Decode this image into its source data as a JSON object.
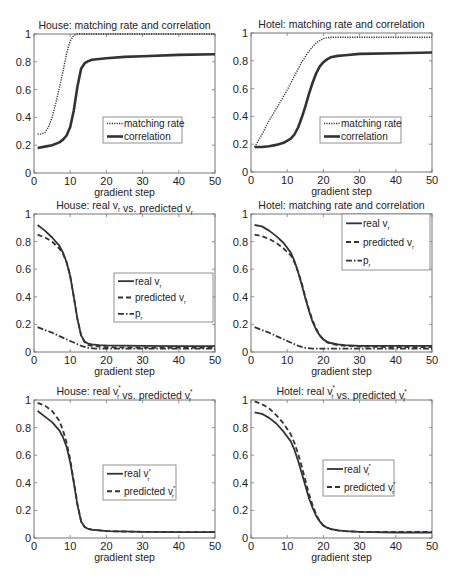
{
  "figure": {
    "width": 452,
    "height": 578,
    "line_color": "#333333",
    "axis_color": "#777777"
  },
  "chart_data": [
    {
      "id": "house-match",
      "type": "line",
      "title": "House: matching rate and correlation",
      "title_parts": [
        {
          "t": "House: matching rate and correlation"
        }
      ],
      "xlabel": "gradient step",
      "ylabel": "",
      "xlim": [
        0,
        50
      ],
      "ylim": [
        0,
        1
      ],
      "xticks": [
        0,
        10,
        20,
        30,
        40,
        50
      ],
      "yticks": [
        0,
        0.2,
        0.4,
        0.6,
        0.8,
        1
      ],
      "ytick_labels": [
        "0",
        "0.2",
        "0.4",
        "0.6",
        "0.8",
        "1"
      ],
      "grid": false,
      "box": {
        "x0": 34,
        "y0": 34,
        "x1": 215,
        "y1": 173
      },
      "legend": {
        "x": 103,
        "y": 117,
        "w": 79,
        "h": 26
      },
      "series": [
        {
          "name": "matching rate",
          "label_parts": [
            {
              "t": "matching rate"
            }
          ],
          "style": "dotted",
          "width": 1.4,
          "x": [
            1,
            2,
            3,
            4,
            5,
            6,
            7,
            8,
            9,
            10,
            11,
            12,
            13,
            14,
            15,
            20,
            30,
            40,
            50
          ],
          "y": [
            0.28,
            0.28,
            0.29,
            0.33,
            0.4,
            0.5,
            0.61,
            0.73,
            0.86,
            0.95,
            0.99,
            1.0,
            1.0,
            1.0,
            1.0,
            1.0,
            1.0,
            1.0,
            1.0
          ]
        },
        {
          "name": "correlation",
          "label_parts": [
            {
              "t": "correlation"
            }
          ],
          "style": "solid",
          "width": 2.6,
          "x": [
            1,
            3,
            5,
            7,
            8,
            9,
            10,
            11,
            12,
            13,
            14,
            15,
            16,
            18,
            20,
            25,
            30,
            40,
            50
          ],
          "y": [
            0.18,
            0.19,
            0.2,
            0.22,
            0.24,
            0.27,
            0.33,
            0.45,
            0.62,
            0.75,
            0.79,
            0.805,
            0.815,
            0.82,
            0.825,
            0.835,
            0.84,
            0.85,
            0.855
          ]
        }
      ]
    },
    {
      "id": "hotel-match",
      "type": "line",
      "title": "Hotel: matching rate and correlation",
      "title_parts": [
        {
          "t": "Hotel: matching rate and correlation"
        }
      ],
      "xlabel": "gradient step",
      "ylabel": "",
      "xlim": [
        0,
        50
      ],
      "ylim": [
        0,
        1
      ],
      "xticks": [
        0,
        10,
        20,
        30,
        40,
        50
      ],
      "yticks": [
        0,
        0.2,
        0.4,
        0.6,
        0.8,
        1
      ],
      "ytick_labels": [
        "0",
        "0.2",
        "0.4",
        "0.6",
        "0.8",
        "1"
      ],
      "grid": false,
      "box": {
        "x0": 251,
        "y0": 33,
        "x1": 432,
        "y1": 172
      },
      "legend": {
        "x": 320,
        "y": 117,
        "w": 81,
        "h": 26
      },
      "series": [
        {
          "name": "matching rate",
          "label_parts": [
            {
              "t": "matching rate"
            }
          ],
          "style": "dotted",
          "width": 1.4,
          "x": [
            1,
            3,
            5,
            8,
            10,
            12,
            14,
            16,
            18,
            20,
            22,
            25,
            30,
            40,
            50
          ],
          "y": [
            0.18,
            0.27,
            0.37,
            0.5,
            0.59,
            0.69,
            0.79,
            0.87,
            0.93,
            0.96,
            0.97,
            0.97,
            0.97,
            0.97,
            0.97
          ]
        },
        {
          "name": "correlation",
          "label_parts": [
            {
              "t": "correlation"
            }
          ],
          "style": "solid",
          "width": 2.6,
          "x": [
            1,
            3,
            5,
            7,
            9,
            11,
            12,
            13,
            14,
            15,
            16,
            17,
            18,
            19,
            20,
            21,
            22,
            24,
            26,
            30,
            40,
            50
          ],
          "y": [
            0.18,
            0.18,
            0.185,
            0.195,
            0.21,
            0.24,
            0.27,
            0.32,
            0.39,
            0.47,
            0.56,
            0.64,
            0.71,
            0.76,
            0.79,
            0.81,
            0.825,
            0.835,
            0.84,
            0.85,
            0.855,
            0.86
          ]
        }
      ]
    },
    {
      "id": "house-vr",
      "type": "line",
      "title": "House: real v_r vs. predicted v_r",
      "title_parts": [
        {
          "t": "House: real v"
        },
        {
          "t": "r",
          "sub": true
        },
        {
          "t": " vs. predicted v"
        },
        {
          "t": "r",
          "sub": true
        }
      ],
      "xlabel": "gradient step",
      "ylabel": "",
      "xlim": [
        0,
        50
      ],
      "ylim": [
        0,
        1
      ],
      "xticks": [
        0,
        10,
        20,
        30,
        40,
        50
      ],
      "yticks": [
        0,
        0.2,
        0.4,
        0.6,
        0.8,
        1
      ],
      "ytick_labels": [
        "0",
        "0.2",
        "0.4",
        "0.6",
        "0.8",
        "1"
      ],
      "grid": false,
      "box": {
        "x0": 34,
        "y0": 214,
        "x1": 215,
        "y1": 352
      },
      "legend": {
        "x": 114,
        "y": 273,
        "w": 99,
        "h": 49
      },
      "series": [
        {
          "name": "real v_r",
          "label_parts": [
            {
              "t": "real v"
            },
            {
              "t": "r",
              "sub": true
            }
          ],
          "style": "solid",
          "width": 1.8,
          "x": [
            1,
            3,
            5,
            7,
            8,
            9,
            10,
            11,
            12,
            13,
            14,
            15,
            16,
            18,
            20,
            30,
            40,
            50
          ],
          "y": [
            0.92,
            0.88,
            0.83,
            0.77,
            0.72,
            0.65,
            0.55,
            0.4,
            0.24,
            0.12,
            0.075,
            0.06,
            0.055,
            0.05,
            0.048,
            0.045,
            0.043,
            0.042
          ]
        },
        {
          "name": "predicted v_r",
          "label_parts": [
            {
              "t": "predicted v"
            },
            {
              "t": "r",
              "sub": true
            }
          ],
          "style": "dashed",
          "width": 1.8,
          "x": [
            1,
            3,
            5,
            7,
            8,
            9,
            10,
            11,
            12,
            13,
            14,
            15,
            16,
            18,
            20,
            30,
            40,
            50
          ],
          "y": [
            0.85,
            0.83,
            0.8,
            0.75,
            0.71,
            0.65,
            0.55,
            0.4,
            0.24,
            0.12,
            0.07,
            0.05,
            0.045,
            0.04,
            0.035,
            0.032,
            0.032,
            0.03
          ]
        },
        {
          "name": "p_r",
          "label_parts": [
            {
              "t": "p"
            },
            {
              "t": "r",
              "sub": true
            }
          ],
          "style": "dashdot",
          "width": 1.8,
          "x": [
            1,
            5,
            10,
            13,
            15,
            17,
            20,
            30,
            40,
            50
          ],
          "y": [
            0.18,
            0.14,
            0.08,
            0.045,
            0.03,
            0.025,
            0.025,
            0.025,
            0.025,
            0.025
          ]
        }
      ]
    },
    {
      "id": "hotel-vr",
      "type": "line",
      "title": "Hotel: matching rate and correlation",
      "title_parts": [
        {
          "t": "Hotel: matching rate and correlation"
        }
      ],
      "xlabel": "gradient step",
      "ylabel": "",
      "xlim": [
        0,
        50
      ],
      "ylim": [
        0,
        1
      ],
      "xticks": [
        0,
        10,
        20,
        30,
        40,
        50
      ],
      "yticks": [
        0,
        0.2,
        0.4,
        0.6,
        0.8,
        1
      ],
      "ytick_labels": [
        "0",
        "0.2",
        "0.4",
        "0.6",
        "0.8",
        "1"
      ],
      "grid": false,
      "box": {
        "x0": 251,
        "y0": 214,
        "x1": 432,
        "y1": 352
      },
      "legend": {
        "x": 342,
        "y": 214,
        "w": 88,
        "h": 56
      },
      "series": [
        {
          "name": "real v_r",
          "label_parts": [
            {
              "t": "real v"
            },
            {
              "t": "r",
              "sub": true
            }
          ],
          "style": "solid",
          "width": 1.8,
          "x": [
            1,
            3,
            5,
            7,
            9,
            11,
            12,
            13,
            14,
            15,
            16,
            17,
            18,
            19,
            20,
            21,
            22,
            24,
            26,
            30,
            40,
            50
          ],
          "y": [
            0.92,
            0.91,
            0.88,
            0.84,
            0.79,
            0.72,
            0.66,
            0.58,
            0.49,
            0.39,
            0.3,
            0.22,
            0.16,
            0.12,
            0.09,
            0.075,
            0.065,
            0.055,
            0.05,
            0.045,
            0.045,
            0.045
          ]
        },
        {
          "name": "predicted v_r",
          "label_parts": [
            {
              "t": "predicted v"
            },
            {
              "t": "r",
              "sub": true
            }
          ],
          "style": "dashed",
          "width": 1.8,
          "x": [
            1,
            3,
            5,
            7,
            9,
            11,
            12,
            13,
            14,
            15,
            16,
            17,
            18,
            19,
            20,
            21,
            22,
            24,
            26,
            30,
            40,
            50
          ],
          "y": [
            0.85,
            0.84,
            0.82,
            0.79,
            0.75,
            0.7,
            0.65,
            0.58,
            0.5,
            0.4,
            0.31,
            0.23,
            0.17,
            0.12,
            0.09,
            0.07,
            0.06,
            0.05,
            0.045,
            0.04,
            0.035,
            0.035
          ]
        },
        {
          "name": "p_r",
          "label_parts": [
            {
              "t": "p"
            },
            {
              "t": "r",
              "sub": true
            }
          ],
          "style": "dashdot",
          "width": 1.8,
          "x": [
            1,
            5,
            10,
            13,
            15,
            17,
            20,
            30,
            40,
            50
          ],
          "y": [
            0.18,
            0.14,
            0.08,
            0.045,
            0.03,
            0.025,
            0.025,
            0.025,
            0.025,
            0.025
          ]
        }
      ]
    },
    {
      "id": "house-vr-star",
      "type": "line",
      "title": "House: real v*_r vs. predicted v*_r",
      "title_parts": [
        {
          "t": "House: real v"
        },
        {
          "t": "r",
          "sub": true,
          "sup": "*"
        },
        {
          "t": " vs. predicted v"
        },
        {
          "t": "r",
          "sub": true,
          "sup": "*"
        }
      ],
      "xlabel": "gradient step",
      "ylabel": "",
      "xlim": [
        0,
        50
      ],
      "ylim": [
        0,
        1
      ],
      "xticks": [
        0,
        10,
        20,
        30,
        40,
        50
      ],
      "yticks": [
        0,
        0.2,
        0.4,
        0.6,
        0.8,
        1
      ],
      "ytick_labels": [
        "0",
        "0.2",
        "0.4",
        "0.6",
        "0.8",
        "1"
      ],
      "grid": false,
      "box": {
        "x0": 34,
        "y0": 400,
        "x1": 215,
        "y1": 538
      },
      "legend": {
        "x": 103,
        "y": 465,
        "w": 73,
        "h": 35
      },
      "series": [
        {
          "name": "real v*_r",
          "label_parts": [
            {
              "t": "real v"
            },
            {
              "t": "r",
              "sub": true,
              "sup": "*"
            }
          ],
          "style": "solid",
          "width": 1.8,
          "x": [
            1,
            3,
            5,
            7,
            8,
            9,
            10,
            11,
            12,
            13,
            14,
            15,
            16,
            18,
            20,
            30,
            40,
            50
          ],
          "y": [
            0.92,
            0.88,
            0.84,
            0.78,
            0.73,
            0.66,
            0.55,
            0.4,
            0.24,
            0.12,
            0.08,
            0.065,
            0.06,
            0.055,
            0.05,
            0.045,
            0.043,
            0.042
          ]
        },
        {
          "name": "predicted v*_r",
          "label_parts": [
            {
              "t": "predicted v"
            },
            {
              "t": "r",
              "sub": true,
              "sup": "*"
            }
          ],
          "style": "dashed",
          "width": 1.8,
          "x": [
            1,
            3,
            5,
            7,
            8,
            9,
            10,
            11,
            12,
            13,
            14,
            15,
            16,
            18,
            20,
            30,
            40,
            50
          ],
          "y": [
            0.98,
            0.96,
            0.92,
            0.85,
            0.78,
            0.69,
            0.57,
            0.41,
            0.25,
            0.12,
            0.08,
            0.065,
            0.06,
            0.055,
            0.05,
            0.045,
            0.043,
            0.042
          ]
        }
      ]
    },
    {
      "id": "hotel-vr-star",
      "type": "line",
      "title": "Hotel: real v*_r vs. predicted v*_r",
      "title_parts": [
        {
          "t": "Hotel: real v"
        },
        {
          "t": "r",
          "sub": true,
          "sup": "*"
        },
        {
          "t": " vs. predicted v"
        },
        {
          "t": "r",
          "sub": true,
          "sup": "*"
        }
      ],
      "xlabel": "gradient step",
      "ylabel": "",
      "xlim": [
        0,
        50
      ],
      "ylim": [
        0,
        1
      ],
      "xticks": [
        0,
        10,
        20,
        30,
        40,
        50
      ],
      "yticks": [
        0,
        0.2,
        0.4,
        0.6,
        0.8,
        1
      ],
      "ytick_labels": [
        "0",
        "0.2",
        "0.4",
        "0.6",
        "0.8",
        "1"
      ],
      "grid": false,
      "box": {
        "x0": 251,
        "y0": 400,
        "x1": 432,
        "y1": 538
      },
      "legend": {
        "x": 323,
        "y": 460,
        "w": 71,
        "h": 36
      },
      "series": [
        {
          "name": "real v*_r",
          "label_parts": [
            {
              "t": "real v"
            },
            {
              "t": "r",
              "sub": true,
              "sup": "*"
            }
          ],
          "style": "solid",
          "width": 1.8,
          "x": [
            1,
            3,
            5,
            7,
            9,
            11,
            12,
            13,
            14,
            15,
            16,
            17,
            18,
            19,
            20,
            21,
            22,
            24,
            26,
            30,
            40,
            50
          ],
          "y": [
            0.91,
            0.9,
            0.87,
            0.83,
            0.77,
            0.7,
            0.64,
            0.56,
            0.47,
            0.38,
            0.29,
            0.22,
            0.16,
            0.12,
            0.09,
            0.075,
            0.065,
            0.055,
            0.05,
            0.045,
            0.04,
            0.04
          ]
        },
        {
          "name": "predicted v*_r",
          "label_parts": [
            {
              "t": "predicted v"
            },
            {
              "t": "r",
              "sub": true,
              "sup": "*"
            }
          ],
          "style": "dashed",
          "width": 1.8,
          "x": [
            1,
            3,
            5,
            7,
            9,
            11,
            12,
            13,
            14,
            15,
            16,
            17,
            18,
            19,
            20,
            21,
            22,
            24,
            26,
            30,
            40,
            50
          ],
          "y": [
            0.99,
            0.97,
            0.94,
            0.89,
            0.83,
            0.75,
            0.69,
            0.61,
            0.52,
            0.42,
            0.32,
            0.24,
            0.17,
            0.12,
            0.09,
            0.075,
            0.065,
            0.055,
            0.05,
            0.045,
            0.045,
            0.045
          ]
        }
      ]
    }
  ]
}
